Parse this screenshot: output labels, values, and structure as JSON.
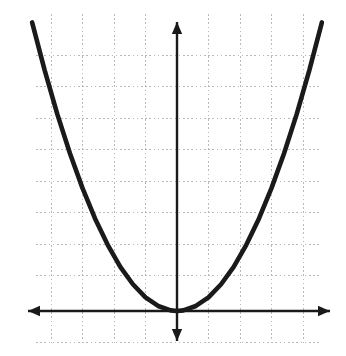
{
  "figure": {
    "width": 346,
    "height": 356,
    "background_color": "#ffffff",
    "alt_text": "Graph of an upward opening parabola with vertex at the origin on a dotted coordinate grid"
  },
  "chart_data": {
    "type": "line",
    "title": "",
    "subtitle": "",
    "xlabel": "",
    "ylabel": "",
    "xlim": [
      -5,
      5
    ],
    "ylim": [
      -1,
      10
    ],
    "xticks": [
      -4,
      -3,
      -2,
      -1,
      0,
      1,
      2,
      3,
      4
    ],
    "yticks": [
      0,
      1,
      2,
      3,
      4,
      5,
      6,
      7,
      8,
      9
    ],
    "xticklabels": [
      "",
      "",
      "",
      "",
      "",
      "",
      "",
      "",
      ""
    ],
    "yticklabels": [
      "",
      "",
      "",
      "",
      "",
      "",
      "",
      "",
      "",
      ""
    ],
    "grid": true,
    "grid_style": "dotted",
    "grid_color": "#b9b9b9",
    "legend": false,
    "legend_position": "none",
    "annotations": [],
    "axes": {
      "x_axis_arrows": "both",
      "y_axis_arrows": "both",
      "x_axis_color": "#1a1a1a",
      "y_axis_color": "#1a1a1a",
      "origin": [
        0,
        0
      ]
    },
    "series": [
      {
        "name": "parabola",
        "equation": "y = 0.433 x^2",
        "color": "#1a1a1a",
        "line_width": 4.6,
        "vertex": [
          0,
          0
        ],
        "opens": "up",
        "x": [
          -4.6,
          -4.2,
          -3.8,
          -3.4,
          -3.0,
          -2.6,
          -2.2,
          -1.8,
          -1.4,
          -1.0,
          -0.6,
          -0.2,
          0.0,
          0.2,
          0.6,
          1.0,
          1.4,
          1.8,
          2.2,
          2.6,
          3.0,
          3.4,
          3.8,
          4.2,
          4.6
        ],
        "values": [
          9.16,
          7.64,
          6.25,
          5.01,
          3.9,
          2.93,
          2.1,
          1.4,
          0.85,
          0.43,
          0.16,
          0.02,
          0.0,
          0.02,
          0.16,
          0.43,
          0.85,
          1.4,
          2.1,
          2.93,
          3.9,
          5.01,
          6.25,
          7.64,
          9.16
        ]
      }
    ]
  },
  "geometry": {
    "origin_px": {
      "x": 177,
      "y": 311
    },
    "unit_px": 31.5,
    "grid_vertical_x": [
      51,
      82.5,
      114,
      145.5,
      208.5,
      240,
      271.5,
      303
    ],
    "grid_horizontal_y": [
      55,
      86.5,
      118,
      149.5,
      181,
      212.5,
      244,
      275.5,
      342
    ],
    "grid_top_y": 14,
    "grid_bottom_y": 344,
    "grid_left_x": 36,
    "grid_right_x": 322,
    "x_axis": {
      "y": 311,
      "x_start": 28,
      "x_end": 330
    },
    "y_axis": {
      "x": 177,
      "y_start": 22,
      "y_end": 341
    },
    "curve_endpoints": [
      {
        "x": 32,
        "y": 22
      },
      {
        "x": 322,
        "y": 22
      }
    ]
  }
}
